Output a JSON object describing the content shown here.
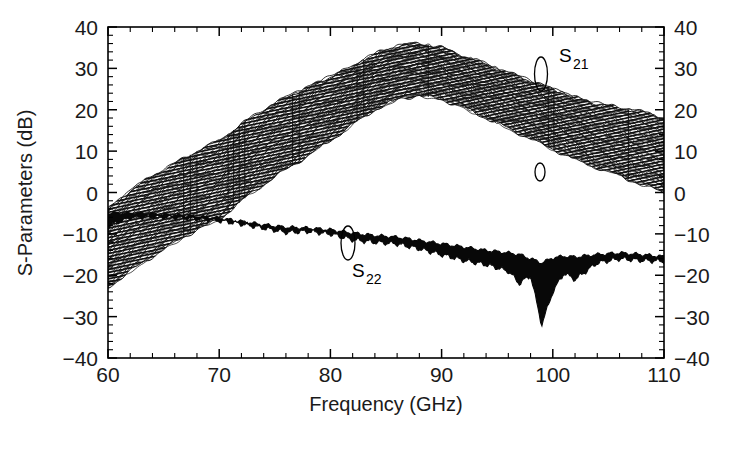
{
  "chart_data": {
    "type": "line",
    "title": "",
    "xlabel": "Frequency (GHz)",
    "ylabel": "S-Parameters (dB)",
    "xlim": [
      60,
      110
    ],
    "ylim": [
      -40,
      40
    ],
    "x_ticks": [
      60,
      70,
      80,
      90,
      100,
      110
    ],
    "y_ticks": [
      40,
      30,
      20,
      10,
      0,
      -10,
      -20,
      -30,
      -40
    ],
    "x_tick_labels": [
      "60",
      "70",
      "80",
      "90",
      "100",
      "110"
    ],
    "y_tick_labels": [
      "40",
      "30",
      "20",
      "10",
      "0",
      "−10",
      "−20",
      "−30",
      "−40"
    ],
    "x_minor_per_major": 5,
    "y_minor_per_major": 5,
    "grid": false,
    "legend_position": "inline-annotations",
    "annotations": [
      {
        "name": "S21",
        "base": "S",
        "sub": "21",
        "x": 103.5,
        "y": 31.0
      },
      {
        "name": "S22",
        "base": "S",
        "sub": "22",
        "x": 81.5,
        "y": -22.5
      }
    ],
    "series": [
      {
        "name": "S21",
        "kind": "band",
        "note": "family of ~40 overlaid traces; hatched band",
        "x": [
          60,
          62,
          64,
          66,
          68,
          70,
          72,
          74,
          76,
          78,
          80,
          82,
          84,
          86,
          88,
          90,
          92,
          94,
          96,
          98,
          100,
          102,
          104,
          106,
          108,
          110
        ],
        "upper": [
          -4.0,
          0.5,
          4.0,
          7.0,
          10.0,
          12.5,
          16.5,
          20.0,
          23.0,
          25.5,
          28.0,
          30.5,
          33.5,
          35.5,
          36.0,
          35.0,
          33.0,
          31.0,
          29.0,
          27.0,
          25.0,
          23.0,
          21.5,
          20.5,
          19.5,
          18.0
        ],
        "lower": [
          -23.0,
          -19.0,
          -15.5,
          -12.0,
          -9.0,
          -6.5,
          -2.0,
          2.0,
          5.5,
          9.0,
          12.5,
          16.5,
          20.0,
          22.5,
          23.5,
          22.5,
          20.5,
          18.0,
          15.5,
          13.0,
          10.5,
          8.0,
          6.0,
          4.0,
          2.0,
          0.0
        ]
      },
      {
        "name": "S22",
        "kind": "band",
        "note": "narrow solid-black band with deep dip near 99 GHz",
        "x": [
          60,
          62,
          64,
          66,
          68,
          70,
          72,
          74,
          76,
          78,
          80,
          82,
          84,
          86,
          88,
          90,
          92,
          94,
          96,
          97,
          98,
          99,
          100,
          101,
          102,
          104,
          106,
          108,
          110
        ],
        "upper": [
          -5.0,
          -5.0,
          -5.2,
          -5.5,
          -5.8,
          -6.2,
          -7.0,
          -7.8,
          -8.4,
          -8.6,
          -9.0,
          -9.8,
          -10.4,
          -10.8,
          -11.6,
          -12.4,
          -13.2,
          -14.0,
          -14.6,
          -15.0,
          -16.0,
          -17.0,
          -15.8,
          -15.4,
          -15.6,
          -15.0,
          -14.6,
          -15.0,
          -15.5
        ],
        "lower": [
          -8.0,
          -6.0,
          -5.8,
          -6.0,
          -6.3,
          -6.8,
          -7.6,
          -8.6,
          -9.6,
          -9.4,
          -10.0,
          -11.4,
          -12.0,
          -12.4,
          -13.6,
          -15.0,
          -16.4,
          -17.4,
          -19.0,
          -22.0,
          -20.0,
          -32.0,
          -24.0,
          -19.5,
          -21.0,
          -17.0,
          -16.0,
          -16.4,
          -16.6
        ]
      }
    ]
  },
  "axes": {
    "x_axis_title": "Frequency (GHz)",
    "y_axis_title": "S-Parameters (dB)"
  }
}
